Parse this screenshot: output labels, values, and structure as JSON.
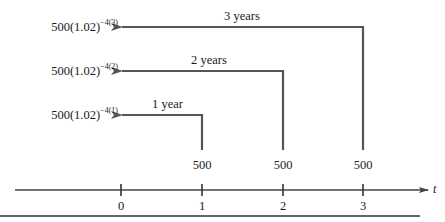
{
  "diagram": {
    "axis": {
      "variable": "t",
      "ticks": [
        {
          "label": "0",
          "x": 121
        },
        {
          "label": "1",
          "x": 202
        },
        {
          "label": "2",
          "x": 283
        },
        {
          "label": "3",
          "x": 363
        }
      ]
    },
    "payments": [
      {
        "amount": "500",
        "time": "1"
      },
      {
        "amount": "500",
        "time": "2"
      },
      {
        "amount": "500",
        "time": "3"
      }
    ],
    "arrows": [
      {
        "duration": "1 year",
        "value_base": "500(1.02)",
        "value_exp": "−4(1)",
        "from_time": "1"
      },
      {
        "duration": "2 years",
        "value_base": "500(1.02)",
        "value_exp": "−4(2)",
        "from_time": "2"
      },
      {
        "duration": "3 years",
        "value_base": "500(1.02)",
        "value_exp": "−4(3)",
        "from_time": "3"
      }
    ],
    "colors": {
      "line": "#555555",
      "text": "#1a1a1a",
      "background": "#ffffff"
    }
  }
}
